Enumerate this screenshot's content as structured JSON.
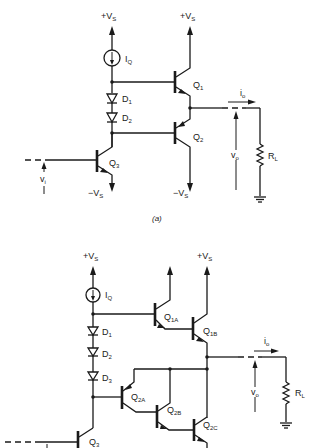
{
  "figure": {
    "subfigures": [
      {
        "id": "a",
        "caption": "(a)",
        "labels": {
          "supply_pos_left": "+V",
          "supply_pos_left_sub": "S",
          "supply_pos_right": "+V",
          "supply_pos_right_sub": "S",
          "supply_neg_left": "−V",
          "supply_neg_left_sub": "S",
          "supply_neg_right": "−V",
          "supply_neg_right_sub": "S",
          "current_source": "I",
          "current_source_sub": "Q",
          "d1": "D",
          "d1_sub": "1",
          "d2": "D",
          "d2_sub": "2",
          "q1": "Q",
          "q1_sub": "1",
          "q2": "Q",
          "q2_sub": "2",
          "q3": "Q",
          "q3_sub": "3",
          "io": "i",
          "io_sub": "o",
          "vo": "v",
          "vo_sub": "o",
          "vi": "v",
          "vi_sub": "i",
          "rl": "R",
          "rl_sub": "L"
        }
      },
      {
        "id": "b",
        "labels": {
          "supply_pos_left": "+V",
          "supply_pos_left_sub": "S",
          "supply_pos_right": "+V",
          "supply_pos_right_sub": "S",
          "current_source": "I",
          "current_source_sub": "Q",
          "d1": "D",
          "d1_sub": "1",
          "d2": "D",
          "d2_sub": "2",
          "d3": "D",
          "d3_sub": "3",
          "q1a": "Q",
          "q1a_sub": "1A",
          "q1b": "Q",
          "q1b_sub": "1B",
          "q2a": "Q",
          "q2a_sub": "2A",
          "q2b": "Q",
          "q2b_sub": "2B",
          "q2c": "Q",
          "q2c_sub": "2C",
          "q3": "Q",
          "q3_sub": "3",
          "io": "i",
          "io_sub": "o",
          "vo": "v",
          "vo_sub": "o",
          "rl": "R",
          "rl_sub": "L"
        }
      }
    ]
  }
}
